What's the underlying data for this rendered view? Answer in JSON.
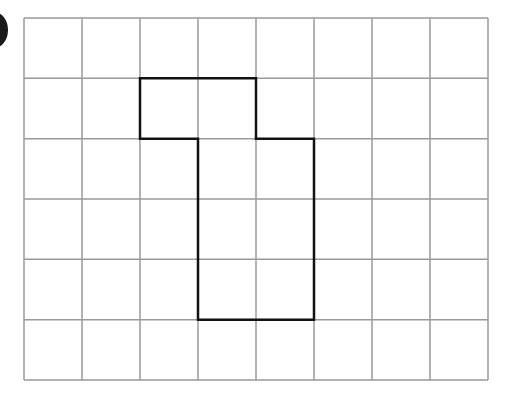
{
  "diagram": {
    "type": "grid-shape",
    "grid": {
      "columns": 8,
      "rows": 6,
      "left": 24,
      "top": 18,
      "right": 488,
      "bottom": 380,
      "line_color": "#9a9a9a",
      "line_width": 1.5
    },
    "shape": {
      "description": "Rectilinear polygon drawn on grid",
      "cells": [
        [
          1,
          2
        ],
        [
          1,
          3
        ],
        [
          2,
          3
        ],
        [
          2,
          4
        ],
        [
          3,
          3
        ],
        [
          3,
          4
        ],
        [
          4,
          3
        ],
        [
          4,
          4
        ]
      ],
      "vertices_grid": [
        [
          2,
          1
        ],
        [
          4,
          1
        ],
        [
          4,
          2
        ],
        [
          5,
          2
        ],
        [
          5,
          5
        ],
        [
          3,
          5
        ],
        [
          3,
          2
        ],
        [
          2,
          2
        ]
      ],
      "stroke_color": "#111111",
      "stroke_width": 2.5
    },
    "marker": {
      "shape": "circle",
      "color": "#1a1a1a",
      "partial": true
    }
  }
}
